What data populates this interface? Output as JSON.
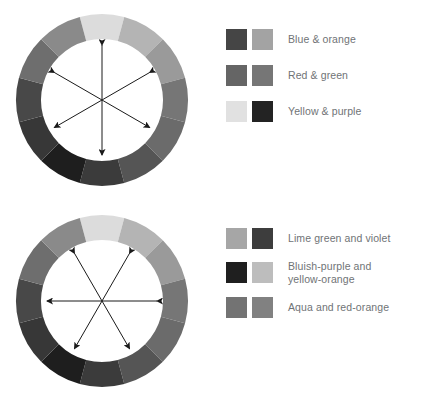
{
  "page": {
    "background": "#ffffff",
    "text_color": "#6f7376"
  },
  "wheel": {
    "segment_count": 12,
    "segments": [
      {
        "name": "yellow",
        "color": "#dcdcdc"
      },
      {
        "name": "yellow-orange",
        "color": "#b4b4b4"
      },
      {
        "name": "orange",
        "color": "#9a9a9a"
      },
      {
        "name": "red-orange",
        "color": "#767676"
      },
      {
        "name": "red",
        "color": "#6b6b6b"
      },
      {
        "name": "red-violet",
        "color": "#555555"
      },
      {
        "name": "violet",
        "color": "#3b3b3b"
      },
      {
        "name": "purple",
        "color": "#1e1e1e"
      },
      {
        "name": "bluish-purple",
        "color": "#373737"
      },
      {
        "name": "blue",
        "color": "#484848"
      },
      {
        "name": "aqua",
        "color": "#6e6e6e"
      },
      {
        "name": "green",
        "color": "#8a8a8a"
      },
      {
        "name": "lime-green",
        "color": "#b0b0b0"
      }
    ],
    "geometry": {
      "center_x": 92,
      "center_y": 92,
      "outer_radius": 86,
      "inner_radius": 61,
      "arrow_radius": 55
    }
  },
  "diagrams": [
    {
      "id": "diagram-1",
      "wheel_rotation_deg": 0,
      "arrow_angles_deg": [
        90,
        30,
        150
      ],
      "legend": {
        "rows": [
          {
            "label": "Blue & orange",
            "swatches": [
              {
                "name": "blue-swatch",
                "color": "#454545"
              },
              {
                "name": "orange-swatch",
                "color": "#a3a3a3"
              }
            ]
          },
          {
            "label": "Red & green",
            "swatches": [
              {
                "name": "red-swatch",
                "color": "#656565"
              },
              {
                "name": "green-swatch",
                "color": "#767676"
              }
            ]
          },
          {
            "label": "Yellow & purple",
            "swatches": [
              {
                "name": "yellow-swatch",
                "color": "#e1e1e1"
              },
              {
                "name": "purple-swatch",
                "color": "#232323"
              }
            ]
          }
        ]
      }
    },
    {
      "id": "diagram-2",
      "wheel_rotation_deg": 0,
      "arrow_angles_deg": [
        0,
        60,
        120
      ],
      "legend": {
        "rows": [
          {
            "label": "Lime green and violet",
            "swatches": [
              {
                "name": "lime-green-swatch",
                "color": "#a6a6a6"
              },
              {
                "name": "violet-swatch",
                "color": "#3d3d3d"
              }
            ]
          },
          {
            "label": "Bluish-purple and\nyellow-orange",
            "swatches": [
              {
                "name": "bluish-purple-swatch",
                "color": "#1f1f1f"
              },
              {
                "name": "yellow-orange-swatch",
                "color": "#bdbdbd"
              }
            ]
          },
          {
            "label": "Aqua and red-orange",
            "swatches": [
              {
                "name": "aqua-swatch",
                "color": "#737373"
              },
              {
                "name": "red-orange-swatch",
                "color": "#818181"
              }
            ]
          }
        ]
      }
    }
  ]
}
